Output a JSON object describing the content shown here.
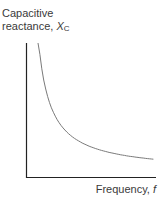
{
  "chart_data": {
    "type": "line",
    "title": "",
    "ylabel": "Capacitive reactance, X_C",
    "xlabel": "Frequency, f",
    "grid": false,
    "legend": null,
    "series": [
      {
        "name": "X_C vs f",
        "relationship": "inverse (X_C = 1 / (2πfC))",
        "x": [
          0.1,
          0.15,
          0.2,
          0.3,
          0.4,
          0.5,
          0.6,
          0.7,
          0.8,
          0.9,
          1.0
        ],
        "values": [
          1.0,
          0.72,
          0.55,
          0.37,
          0.28,
          0.22,
          0.18,
          0.15,
          0.12,
          0.1,
          0.09
        ]
      }
    ],
    "xticks": [],
    "yticks": []
  },
  "labels": {
    "y_prefix": "Capacitive",
    "y_line2": "reactance, ",
    "y_symbol": "X",
    "y_subscript": "C",
    "x_text": "Frequency, ",
    "x_symbol": "f"
  },
  "colors": {
    "axis": "#222222",
    "curve": "#7a7a7a"
  }
}
